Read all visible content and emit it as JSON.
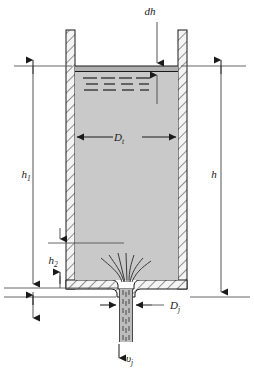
{
  "figure": {
    "background_color": "#ffffff",
    "width": 254,
    "height": 380
  },
  "colors": {
    "line": "#1a1a1a",
    "thin_line": "#555555",
    "liquid_fill": "#c9c9c9",
    "slab_fill": "#b0b0b0",
    "wall_fill": "#f2f2f2",
    "hatch": "#4a4a4a",
    "jet_fill": "#bdbdbd",
    "streamline": "#3a3a3a"
  },
  "labels": {
    "dh": {
      "text": "dh",
      "italic": true
    },
    "tank_diameter": {
      "base": "D",
      "sub": "t"
    },
    "jet_diameter": {
      "base": "D",
      "sub": "j"
    },
    "jet_velocity": {
      "base": "υ",
      "sub": "j"
    },
    "height_total": {
      "base": "h",
      "sub": ""
    },
    "height_1": {
      "base": "h",
      "sub": "1"
    },
    "height_2": {
      "base": "h",
      "sub": "2"
    }
  },
  "geometry": {
    "tank_outer_left": 66,
    "tank_outer_right": 187,
    "tank_top": 30,
    "tank_bottom": 289,
    "wall_thickness": 9,
    "liquid_surface_y": 66,
    "slab_bottom_y": 71,
    "nozzle_exit_y": 297,
    "jet_bottom_y": 342,
    "jet_left": 117,
    "jet_right": 134,
    "dim_left_x": 33,
    "dim_right_x": 221,
    "dim_h2_x": 60,
    "h1_bottom_y": 288,
    "h2_top_y": 243,
    "dt_line_y": 137,
    "dj_line_y": 305
  },
  "surface_dashes": {
    "rows": [
      {
        "y": 78,
        "segments": [
          [
            83,
            14
          ],
          [
            101,
            14
          ],
          [
            119,
            13
          ],
          [
            136,
            14
          ]
        ]
      },
      {
        "y": 84,
        "segments": [
          [
            86,
            12
          ],
          [
            104,
            11
          ],
          [
            121,
            12
          ],
          [
            139,
            10
          ]
        ]
      },
      {
        "y": 90,
        "segments": [
          [
            84,
            14
          ],
          [
            103,
            13
          ],
          [
            122,
            12
          ],
          [
            140,
            9
          ]
        ]
      }
    ]
  }
}
